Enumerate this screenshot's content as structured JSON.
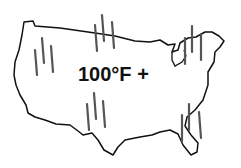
{
  "illustration": {
    "subject": "us-map-heat-wave",
    "label": "100°F +",
    "outline_color": "#111111",
    "heat_mark_color": "#555555"
  }
}
